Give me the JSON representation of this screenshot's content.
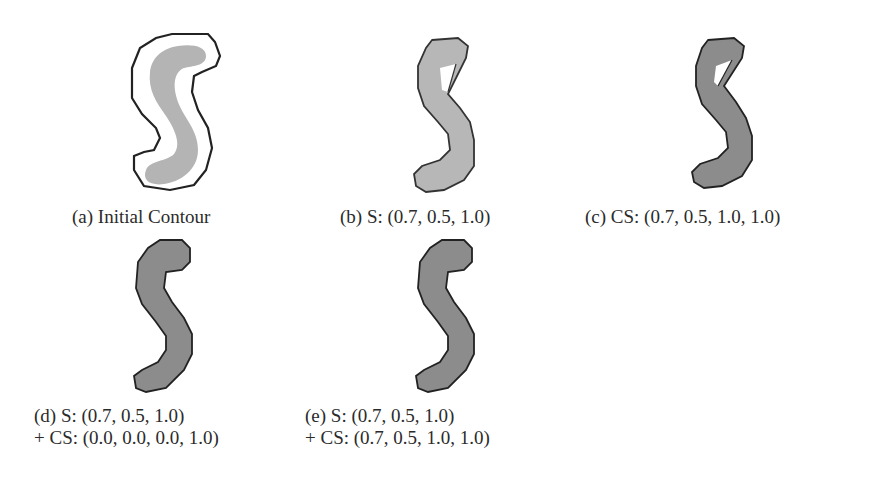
{
  "figure": {
    "subfigures": [
      {
        "id": "a",
        "caption_line1": "(a) Initial Contour",
        "caption_line2": "",
        "shape_fill": "#b4b4b4",
        "contour_type": "loose-initial-outline",
        "contour_color": "#222222"
      },
      {
        "id": "b",
        "caption_line1": "(b) S: (0.7, 0.5, 1.0)",
        "caption_line2": "",
        "shape_fill": "#b7b7b7",
        "contour_type": "tight-with-gap",
        "contour_color": "#333333"
      },
      {
        "id": "c",
        "caption_line1": "(c) CS: (0.7, 0.5, 1.0, 1.0)",
        "caption_line2": "",
        "shape_fill": "#8c8c8c",
        "contour_type": "tight-with-gap",
        "contour_color": "#222222"
      },
      {
        "id": "d",
        "caption_line1": "(d) S: (0.7, 0.5, 1.0)",
        "caption_line2": "+ CS: (0.0, 0.0, 0.0, 1.0)",
        "shape_fill": "#8c8c8c",
        "contour_type": "tight-full",
        "contour_color": "#222222"
      },
      {
        "id": "e",
        "caption_line1": "(e) S: (0.7, 0.5, 1.0)",
        "caption_line2": "+ CS: (0.7, 0.5, 1.0, 1.0)",
        "shape_fill": "#8c8c8c",
        "contour_type": "tight-full",
        "contour_color": "#222222"
      }
    ]
  }
}
